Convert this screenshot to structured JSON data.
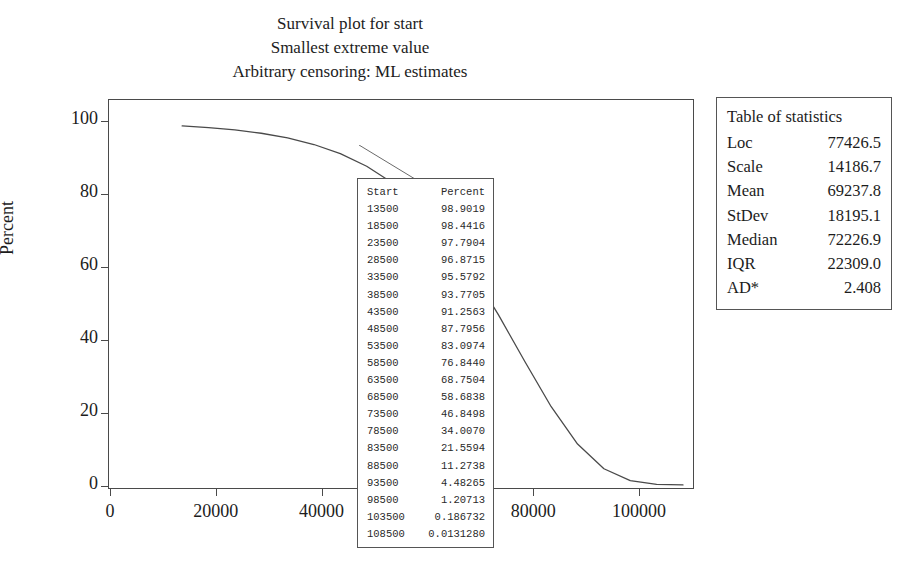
{
  "titles": {
    "line1": "Survival plot for start",
    "line2": "Smallest extreme value",
    "line3": "Arbitrary censoring: ML estimates"
  },
  "axes": {
    "ylabel": "Percent",
    "xlabel": "",
    "yticks": [
      "0",
      "20",
      "40",
      "60",
      "80",
      "100"
    ],
    "xticks": [
      "0",
      "20000",
      "40000",
      "60000",
      "80000",
      "100000"
    ]
  },
  "data_table": {
    "headers": [
      "Start",
      "Percent"
    ],
    "rows": [
      [
        "13500",
        "98.9019"
      ],
      [
        "18500",
        "98.4416"
      ],
      [
        "23500",
        "97.7904"
      ],
      [
        "28500",
        "96.8715"
      ],
      [
        "33500",
        "95.5792"
      ],
      [
        "38500",
        "93.7705"
      ],
      [
        "43500",
        "91.2563"
      ],
      [
        "48500",
        "87.7956"
      ],
      [
        "53500",
        "83.0974"
      ],
      [
        "58500",
        "76.8440"
      ],
      [
        "63500",
        "68.7504"
      ],
      [
        "68500",
        "58.6838"
      ],
      [
        "73500",
        "46.8498"
      ],
      [
        "78500",
        "34.0070"
      ],
      [
        "83500",
        "21.5594"
      ],
      [
        "88500",
        "11.2738"
      ],
      [
        "93500",
        "4.48265"
      ],
      [
        "98500",
        "1.20713"
      ],
      [
        "103500",
        "0.186732"
      ],
      [
        "108500",
        "0.0131280"
      ]
    ]
  },
  "stats_table": {
    "title": "Table of statistics",
    "rows": [
      [
        "Loc",
        "77426.5"
      ],
      [
        "Scale",
        "14186.7"
      ],
      [
        "Mean",
        "69237.8"
      ],
      [
        "StDev",
        "18195.1"
      ],
      [
        "Median",
        "72226.9"
      ],
      [
        "IQR",
        "22309.0"
      ],
      [
        "AD*",
        "2.408"
      ]
    ]
  },
  "chart_data": {
    "type": "line",
    "title": "Survival plot for start",
    "subtitle": "Smallest extreme value / Arbitrary censoring: ML estimates",
    "xlabel": "",
    "ylabel": "Percent",
    "xlim": [
      0,
      110000
    ],
    "ylim": [
      0,
      105
    ],
    "xticks": [
      0,
      20000,
      40000,
      60000,
      80000,
      100000
    ],
    "yticks": [
      0,
      20,
      40,
      60,
      80,
      100
    ],
    "grid": false,
    "legend": false,
    "series": [
      {
        "name": "Survival (Percent)",
        "x": [
          13500,
          18500,
          23500,
          28500,
          33500,
          38500,
          43500,
          48500,
          53500,
          58500,
          63500,
          68500,
          73500,
          78500,
          83500,
          88500,
          93500,
          98500,
          103500,
          108500
        ],
        "values": [
          98.9019,
          98.4416,
          97.7904,
          96.8715,
          95.5792,
          93.7705,
          91.2563,
          87.7956,
          83.0974,
          76.844,
          68.7504,
          58.6838,
          46.8498,
          34.007,
          21.5594,
          11.2738,
          4.48265,
          1.20713,
          0.186732,
          0.013128
        ]
      }
    ],
    "annotations": [
      {
        "kind": "table",
        "label": "Start / Percent data table"
      },
      {
        "kind": "table",
        "label": "Table of statistics"
      }
    ]
  },
  "colors": {
    "curve": "#4a4a4a",
    "frame": "#4a4a4a",
    "text": "#1c1c1c"
  }
}
